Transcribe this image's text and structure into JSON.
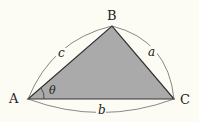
{
  "vertices": {
    "A": "A",
    "B": "B",
    "C": "C"
  },
  "sides": {
    "a": "a",
    "b": "b",
    "c": "c"
  },
  "angle": "θ",
  "colors": {
    "fill": "#aaaaaa",
    "stroke": "#333333",
    "background": "#fdfcf4"
  }
}
